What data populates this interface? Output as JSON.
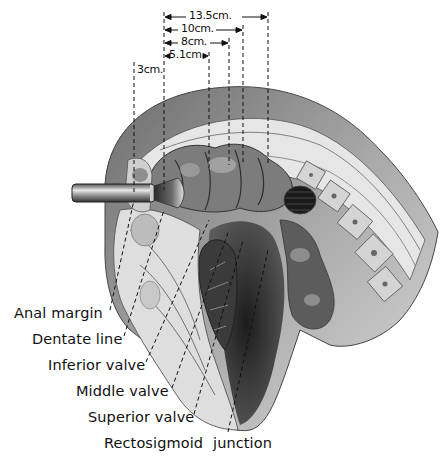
{
  "figure": {
    "type": "anatomical illustration",
    "colors": {
      "ink": "#111111",
      "tissue_dark": "#3a3a3a",
      "tissue_mid": "#8a8a8a",
      "tissue_light": "#d6d6d6",
      "background": "#ffffff"
    }
  },
  "measurements": [
    {
      "label": "13.5cm.",
      "from_x": 164,
      "to_x": 268,
      "y": 17
    },
    {
      "label": "10cm.",
      "from_x": 164,
      "to_x": 243,
      "y": 30
    },
    {
      "label": "8cm.",
      "from_x": 164,
      "to_x": 229,
      "y": 43
    },
    {
      "label": "5.1cm.",
      "from_x": 164,
      "to_x": 209,
      "y": 56
    },
    {
      "label": "3cm.",
      "from_x": 134,
      "to_x": 164,
      "y": 70
    }
  ],
  "labels": [
    {
      "text": "Anal margin",
      "x": 14,
      "y": 313
    },
    {
      "text": "Dentate line",
      "x": 32,
      "y": 339
    },
    {
      "text": "Inferior valve",
      "x": 48,
      "y": 365
    },
    {
      "text": "Middle valve",
      "x": 76,
      "y": 391
    },
    {
      "text": "Superior valve",
      "x": 88,
      "y": 417
    },
    {
      "text": "Rectosigmoid",
      "x": 104,
      "y": 443
    },
    {
      "text": "junction",
      "x": 213,
      "y": 443
    }
  ],
  "instrument": {
    "name": "proctoscope"
  }
}
